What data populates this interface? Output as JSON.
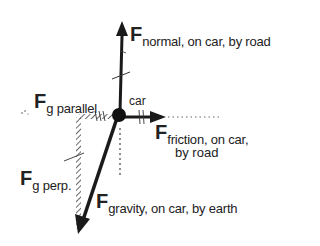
{
  "diagram": {
    "type": "free-body diagram",
    "object_label": "car",
    "colors": {
      "ink": "#1a1a1a",
      "hatch": "#555555",
      "background": "#ffffff"
    },
    "forces": [
      {
        "id": "normal",
        "symbol": "F",
        "subscript": "normal, on car, by road",
        "direction": "up"
      },
      {
        "id": "friction",
        "symbol": "F",
        "subscript_line1": "friction, on car,",
        "subscript_line2": "by road",
        "direction": "right"
      },
      {
        "id": "gravity",
        "symbol": "F",
        "subscript": "gravity, on car, by earth",
        "direction": "down-left"
      },
      {
        "id": "g_parallel",
        "symbol": "F",
        "subscript": "g parallel",
        "direction": "left",
        "style": "hatched"
      },
      {
        "id": "g_perp",
        "symbol": "F",
        "subscript": "g perp.",
        "direction": "down",
        "style": "hatched"
      }
    ]
  }
}
